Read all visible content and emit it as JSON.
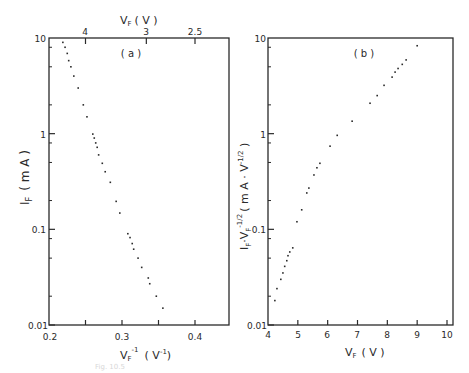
{
  "chart_data": [
    {
      "type": "scatter",
      "panel_label": "( a )",
      "title": "",
      "xlabel": "V_F^-1 (V^-1)",
      "ylabel": "I_F (mA)",
      "top_xlabel": "V_F (V)",
      "xlim": [
        0.2,
        0.446
      ],
      "ylim": [
        0.01,
        10
      ],
      "yscale": "log",
      "x_ticks": [
        "0.2",
        "0.3",
        "0.4"
      ],
      "x_tick_values": [
        0.2,
        0.3,
        0.4
      ],
      "x_minor_ticks": [
        0.25,
        0.35
      ],
      "y_ticks": [
        "0.01",
        "0.1",
        "1",
        "10"
      ],
      "top_x_ticks": [
        "4",
        "3",
        "2.5"
      ],
      "top_x_tick_values_inverse": [
        0.25,
        0.3333,
        0.4
      ],
      "grid": false,
      "x": [
        0.219,
        0.222,
        0.225,
        0.227,
        0.23,
        0.234,
        0.24,
        0.247,
        0.252,
        0.26,
        0.262,
        0.264,
        0.266,
        0.268,
        0.273,
        0.277,
        0.284,
        0.292,
        0.297,
        0.308,
        0.311,
        0.314,
        0.316,
        0.322,
        0.327,
        0.336,
        0.338,
        0.347,
        0.356
      ],
      "y": [
        9.0,
        8.0,
        6.9,
        5.8,
        5.0,
        4.0,
        3.0,
        2.0,
        1.5,
        0.99,
        0.9,
        0.8,
        0.72,
        0.6,
        0.49,
        0.4,
        0.31,
        0.196,
        0.148,
        0.09,
        0.082,
        0.071,
        0.062,
        0.05,
        0.04,
        0.031,
        0.027,
        0.02,
        0.015
      ]
    },
    {
      "type": "scatter",
      "panel_label": "( b )",
      "title": "",
      "xlabel": "V_F (V)",
      "ylabel": "I_F · V_F^-1/2 (mA · V^-1/2)",
      "xlim": [
        4,
        10
      ],
      "ylim": [
        0.01,
        10
      ],
      "yscale": "log",
      "x_ticks": [
        "4",
        "5",
        "6",
        "7",
        "8",
        "9",
        "10"
      ],
      "y_ticks": [
        "0.01",
        "0.1",
        "1",
        "10"
      ],
      "grid": false,
      "x": [
        4.23,
        4.3,
        4.43,
        4.5,
        4.56,
        4.63,
        4.67,
        4.73,
        4.83,
        4.97,
        5.13,
        5.3,
        5.37,
        5.54,
        5.64,
        5.74,
        6.08,
        6.32,
        6.82,
        7.42,
        7.66,
        7.89,
        8.16,
        8.26,
        8.36,
        8.5,
        8.63,
        9.0
      ],
      "y": [
        0.018,
        0.024,
        0.03,
        0.035,
        0.041,
        0.047,
        0.053,
        0.058,
        0.064,
        0.12,
        0.16,
        0.24,
        0.27,
        0.37,
        0.44,
        0.49,
        0.74,
        0.96,
        1.35,
        2.08,
        2.5,
        3.2,
        3.9,
        4.4,
        4.8,
        5.3,
        5.9,
        8.3
      ]
    }
  ],
  "labels": {
    "panel_a": "( a )",
    "panel_b": "( b )",
    "top_axis_title_main": "V",
    "top_axis_title_sub": "F",
    "top_axis_title_unit": "( V )",
    "left_ylabel_main": "I",
    "left_ylabel_sub": "F",
    "left_ylabel_unit": "( m A )",
    "left_xlabel_main": "V",
    "left_xlabel_sub": "F",
    "left_xlabel_sup": "-1",
    "left_xlabel_unit": "( V",
    "left_xlabel_unit_sup": "-1",
    "left_xlabel_unit_close": ")",
    "right_xlabel_main": "V",
    "right_xlabel_sub": "F",
    "right_xlabel_unit": "( V )",
    "right_ylabel": "I_F · V_F^-1/2 ( m A · V^-1/2 )",
    "caption": "Fig. 10.5"
  },
  "ticks": {
    "a_x": [
      "0.2",
      "0.3",
      "0.4"
    ],
    "a_y": [
      "10",
      "1",
      "0.1",
      "0.01"
    ],
    "a_top": [
      "4",
      "3",
      "2.5"
    ],
    "b_x": [
      "4",
      "5",
      "6",
      "7",
      "8",
      "9",
      "10"
    ],
    "b_y": [
      "10",
      "1",
      "0.1",
      "0.01"
    ]
  },
  "colors": {
    "ink": "#2a2a2a",
    "background": "#ffffff"
  }
}
